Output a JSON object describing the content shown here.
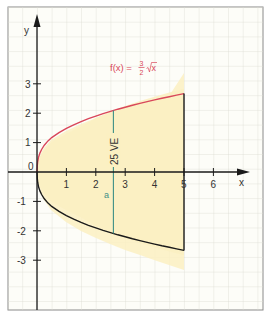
{
  "figure": {
    "y_axis_label": "y",
    "x_axis_label": "x",
    "origin_label": "0",
    "x_ticks": [
      "1",
      "2",
      "3",
      "4",
      "5",
      "6"
    ],
    "y_ticks": [
      "3",
      "2",
      "1",
      "-1",
      "-2",
      "-3"
    ],
    "function_label": "f(x) =",
    "fraction_num": "3",
    "fraction_den": "2",
    "sqrt_arg": "x",
    "segment_label": "a",
    "unit_label": "25 VE",
    "colors": {
      "upper_curve": "#d9475a",
      "lower_curve": "#1a1a1a",
      "fill": "#fbf0c2",
      "grid": "#dcdcd4",
      "segment": "#3d8f86",
      "background": "#fdfdf8"
    }
  }
}
